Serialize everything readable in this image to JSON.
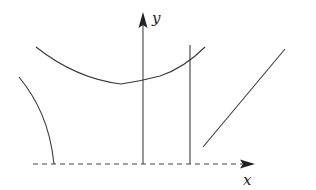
{
  "diagram": {
    "type": "function-graph-sketch",
    "axes": {
      "x_label": "x",
      "y_label": "y",
      "x_axis_style": "dashed",
      "y_axis_style": "solid"
    },
    "elements": [
      {
        "name": "upper-curve",
        "kind": "parabola-like curve with minimum slightly left of y-axis"
      },
      {
        "name": "left-curve",
        "kind": "curve descending to x-axis (vertical asymptote-like)"
      },
      {
        "name": "vertical-line",
        "kind": "vertical line right of y-axis"
      },
      {
        "name": "diagonal-line",
        "kind": "oblique line segment rising to the right"
      }
    ],
    "colors": {
      "stroke": "#3a3a3a",
      "background": "#ffffff"
    }
  }
}
